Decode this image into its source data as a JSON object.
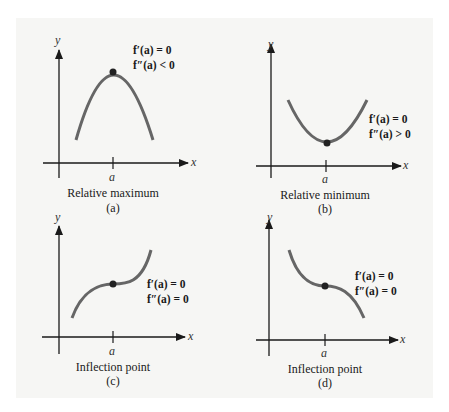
{
  "figure": {
    "background_color": "#f6f6f4",
    "curve_color": "#666666",
    "axis_color": "#1a1a1a",
    "point_color": "#222222",
    "panels": [
      {
        "id": "a",
        "caption": "Relative maximum",
        "sublabel": "(a)",
        "eq1": "f′(a) = 0",
        "eq2": "f″(a) < 0",
        "x_axis": "x",
        "y_axis": "y",
        "tick_label": "a"
      },
      {
        "id": "b",
        "caption": "Relative minimum",
        "sublabel": "(b)",
        "eq1": "f′(a) = 0",
        "eq2": "f″(a) > 0",
        "x_axis": "x",
        "y_axis": "y",
        "tick_label": "a"
      },
      {
        "id": "c",
        "caption": "Inflection point",
        "sublabel": "(c)",
        "eq1": "f′(a) = 0",
        "eq2": "f″(a) = 0",
        "x_axis": "x",
        "y_axis": "y",
        "tick_label": "a"
      },
      {
        "id": "d",
        "caption": "Inflection point",
        "sublabel": "(d)",
        "eq1": "f′(a) = 0",
        "eq2": "f″(a) = 0",
        "x_axis": "x",
        "y_axis": "y",
        "tick_label": "a"
      }
    ]
  }
}
